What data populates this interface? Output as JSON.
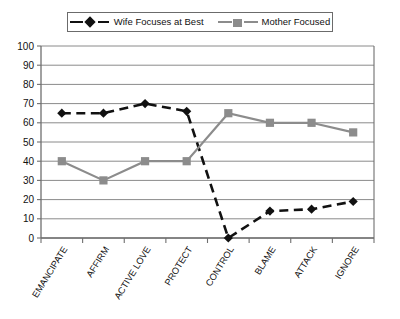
{
  "legend": {
    "entries": [
      {
        "label": "Wife Focuses at Best",
        "color": "#111111",
        "marker": "diamond",
        "style": "dashed"
      },
      {
        "label": "Mother Focused",
        "color": "#8c8c8c",
        "marker": "square",
        "style": "solid"
      }
    ]
  },
  "axis": {
    "y_ticks": [
      "100",
      "90",
      "80",
      "70",
      "60",
      "50",
      "40",
      "30",
      "20",
      "10",
      "0"
    ]
  },
  "chart_data": {
    "type": "line",
    "title": "",
    "subtitle": "",
    "xlabel": "",
    "ylabel": "",
    "categories": [
      "EMANCIPATE",
      "AFFIRM",
      "ACTIVE LOVE",
      "PROTECT",
      "CONTROL",
      "BLAME",
      "ATTACK",
      "IGNORE"
    ],
    "series": [
      {
        "name": "Wife Focuses at Best",
        "color": "#111111",
        "marker": "diamond",
        "line_style": "dashed",
        "values": [
          65,
          65,
          70,
          66,
          0,
          14,
          15,
          19
        ]
      },
      {
        "name": "Mother Focused",
        "color": "#8c8c8c",
        "marker": "square",
        "line_style": "solid",
        "values": [
          40,
          30,
          40,
          40,
          65,
          60,
          60,
          55
        ]
      }
    ],
    "ylim": [
      0,
      100
    ],
    "ytick_step": 10,
    "grid": true,
    "legend_position": "top"
  }
}
